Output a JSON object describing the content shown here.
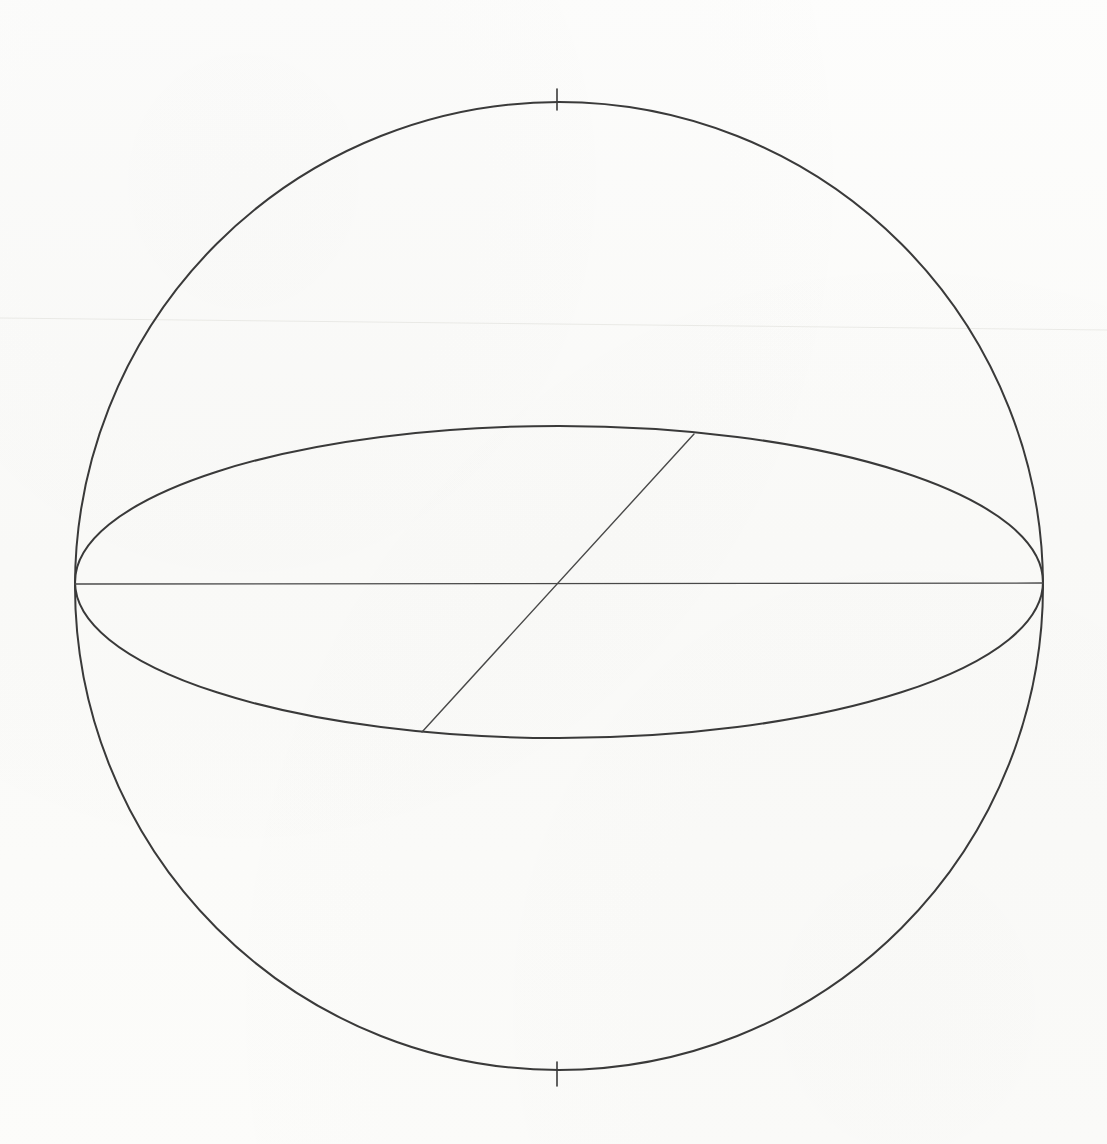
{
  "figure": {
    "kind": "line-drawing",
    "medium": "scanned ink drawing on paper",
    "canvas": {
      "width": 1107,
      "height": 1144
    },
    "background_color": "#fdfdfc",
    "ink_color": "#3a3a3a",
    "faint_ink_color": "#9a9a9a",
    "artifact_color": "#ededea"
  },
  "geometry": {
    "sphere_outline": {
      "name": "sphere-outline",
      "shape": "circle",
      "center": {
        "x": 559,
        "y": 586
      },
      "radius": 484,
      "stroke_width": 2.0,
      "stroke": "#3a3a3a"
    },
    "equator_ellipse": {
      "name": "equator-ellipse",
      "shape": "ellipse",
      "center": {
        "x": 559,
        "y": 582
      },
      "semi_major_x": 484,
      "semi_minor_y": 156,
      "stroke_width": 2.0,
      "stroke": "#3a3a3a",
      "description": "great circle of the sphere seen obliquely, foreshortened into an ellipse"
    },
    "horizontal_diameter": {
      "name": "horizontal-diameter",
      "shape": "line",
      "from": {
        "x": 75,
        "y": 584
      },
      "to": {
        "x": 1043,
        "y": 583
      },
      "stroke_width": 1.3,
      "stroke": "#4a4a4a",
      "description": "major axis of the equatorial ellipse, spanning left to right limb"
    },
    "oblique_diameter": {
      "name": "oblique-diameter",
      "shape": "line",
      "from": {
        "x": 422,
        "y": 732
      },
      "to": {
        "x": 694,
        "y": 434
      },
      "stroke_width": 1.4,
      "stroke": "#4a4a4a",
      "description": "second diameter of the equatorial disc, drawn as a chord from lower-left rim to upper-right rim through the centre"
    },
    "pole_tick_top": {
      "name": "pole-tick-top",
      "shape": "line",
      "from": {
        "x": 557,
        "y": 89
      },
      "to": {
        "x": 557,
        "y": 110
      },
      "stroke_width": 1.6,
      "stroke": "#3a3a3a",
      "description": "short tick at the north pole, extending inward from the outline"
    },
    "pole_tick_bottom": {
      "name": "pole-tick-bottom",
      "shape": "line",
      "from": {
        "x": 557,
        "y": 1062
      },
      "to": {
        "x": 557,
        "y": 1086
      },
      "stroke_width": 1.6,
      "stroke": "#3a3a3a",
      "description": "short tick at the south pole, extending inward from the outline"
    },
    "scan_artifact_line": {
      "name": "scan-artifact-line",
      "shape": "line",
      "from": {
        "x": 0,
        "y": 318
      },
      "to": {
        "x": 1107,
        "y": 330
      },
      "stroke_width": 1.0,
      "stroke": "#ededea",
      "description": "very faint near-horizontal crease/scan seam crossing the whole sheet"
    },
    "center_point": {
      "name": "sphere-center",
      "x": 558,
      "y": 583,
      "description": "intersection of the horizontal and oblique diameters"
    }
  },
  "labels": {
    "visible_text": []
  }
}
